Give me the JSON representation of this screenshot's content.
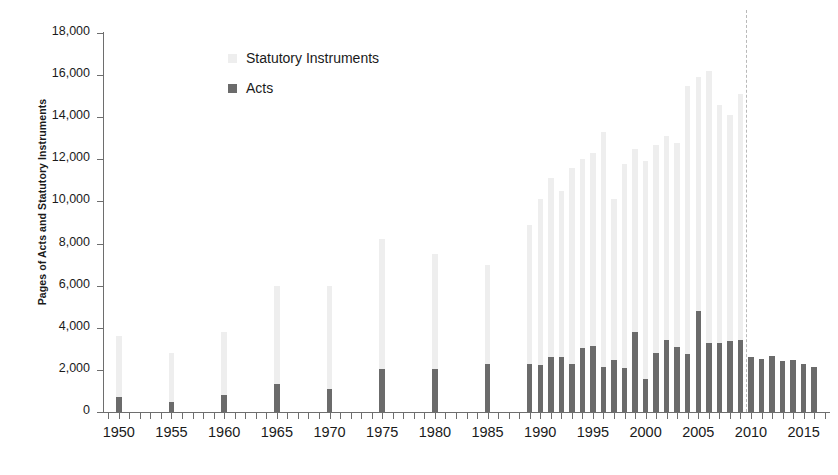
{
  "chart_data": {
    "type": "bar",
    "stacked": true,
    "title": "",
    "subtitle": "",
    "xlabel": "",
    "ylabel": "Pages of Acts and Statutory Instruments",
    "ylim": [
      0,
      18000
    ],
    "ytick_step": 2000,
    "ytick_labels": [
      "0",
      "2,000",
      "4,000",
      "6,000",
      "8,000",
      "10,000",
      "12,000",
      "14,000",
      "16,000",
      "18,000"
    ],
    "ytick_values": [
      0,
      2000,
      4000,
      6000,
      8000,
      10000,
      12000,
      14000,
      16000,
      18000
    ],
    "xlim": [
      1948.5,
      2017.5
    ],
    "xtick_labels": [
      "1950",
      "1955",
      "1960",
      "1965",
      "1970",
      "1975",
      "1980",
      "1985",
      "1990",
      "1995",
      "2000",
      "2005",
      "2010",
      "2015"
    ],
    "xtick_values": [
      1950,
      1955,
      1960,
      1965,
      1970,
      1975,
      1980,
      1985,
      1990,
      1995,
      2000,
      2005,
      2010,
      2015
    ],
    "x_minor_tick_step": 1,
    "grid": false,
    "legend_position": "top-left-inside",
    "series": [
      {
        "name": "Statutory Instruments",
        "color": "#eeeeee",
        "legend_order": 1
      },
      {
        "name": "Acts",
        "color": "#6b6b6b",
        "legend_order": 2
      }
    ],
    "annotations": [
      {
        "name": "si-data-end-line",
        "type": "vline",
        "x": 2009.5,
        "style": "dashed",
        "color": "#b9b9b9",
        "label": ""
      }
    ],
    "points": [
      {
        "year": 1950,
        "acts": 700,
        "statutory_instruments": 2900,
        "total": 3600
      },
      {
        "year": 1955,
        "acts": 480,
        "statutory_instruments": 2320,
        "total": 2800
      },
      {
        "year": 1960,
        "acts": 820,
        "statutory_instruments": 2980,
        "total": 3800
      },
      {
        "year": 1965,
        "acts": 1350,
        "statutory_instruments": 4650,
        "total": 6000
      },
      {
        "year": 1970,
        "acts": 1100,
        "statutory_instruments": 4900,
        "total": 6000
      },
      {
        "year": 1975,
        "acts": 2020,
        "statutory_instruments": 6180,
        "total": 8200
      },
      {
        "year": 1980,
        "acts": 2030,
        "statutory_instruments": 5470,
        "total": 7500
      },
      {
        "year": 1985,
        "acts": 2300,
        "statutory_instruments": 4700,
        "total": 7000
      },
      {
        "year": 1989,
        "acts": 2300,
        "statutory_instruments": 6600,
        "total": 8900
      },
      {
        "year": 1990,
        "acts": 2250,
        "statutory_instruments": 7850,
        "total": 10100
      },
      {
        "year": 1991,
        "acts": 2620,
        "statutory_instruments": 8480,
        "total": 11100
      },
      {
        "year": 1992,
        "acts": 2600,
        "statutory_instruments": 7900,
        "total": 10500
      },
      {
        "year": 1993,
        "acts": 2280,
        "statutory_instruments": 9320,
        "total": 11600
      },
      {
        "year": 1994,
        "acts": 3020,
        "statutory_instruments": 8980,
        "total": 12000
      },
      {
        "year": 1995,
        "acts": 3120,
        "statutory_instruments": 9180,
        "total": 12300
      },
      {
        "year": 1996,
        "acts": 2120,
        "statutory_instruments": 11180,
        "total": 13300
      },
      {
        "year": 1997,
        "acts": 2480,
        "statutory_instruments": 7620,
        "total": 10100
      },
      {
        "year": 1998,
        "acts": 2080,
        "statutory_instruments": 9720,
        "total": 11800
      },
      {
        "year": 1999,
        "acts": 3800,
        "statutory_instruments": 8700,
        "total": 12500
      },
      {
        "year": 2000,
        "acts": 1550,
        "statutory_instruments": 10350,
        "total": 11900
      },
      {
        "year": 2001,
        "acts": 2800,
        "statutory_instruments": 9900,
        "total": 12700
      },
      {
        "year": 2002,
        "acts": 3400,
        "statutory_instruments": 9700,
        "total": 13100
      },
      {
        "year": 2003,
        "acts": 3100,
        "statutory_instruments": 9700,
        "total": 12800
      },
      {
        "year": 2004,
        "acts": 2750,
        "statutory_instruments": 12750,
        "total": 15500
      },
      {
        "year": 2005,
        "acts": 4800,
        "statutory_instruments": 11100,
        "total": 15900
      },
      {
        "year": 2006,
        "acts": 3300,
        "statutory_instruments": 12900,
        "total": 16200
      },
      {
        "year": 2007,
        "acts": 3280,
        "statutory_instruments": 11320,
        "total": 14600
      },
      {
        "year": 2008,
        "acts": 3350,
        "statutory_instruments": 10750,
        "total": 14100
      },
      {
        "year": 2009,
        "acts": 3400,
        "statutory_instruments": 11700,
        "total": 15100
      },
      {
        "year": 2010,
        "acts": 2620,
        "statutory_instruments": 0,
        "total": 2620
      },
      {
        "year": 2011,
        "acts": 2540,
        "statutory_instruments": 0,
        "total": 2540
      },
      {
        "year": 2012,
        "acts": 2650,
        "statutory_instruments": 0,
        "total": 2650
      },
      {
        "year": 2013,
        "acts": 2420,
        "statutory_instruments": 0,
        "total": 2420
      },
      {
        "year": 2014,
        "acts": 2450,
        "statutory_instruments": 0,
        "total": 2450
      },
      {
        "year": 2015,
        "acts": 2300,
        "statutory_instruments": 0,
        "total": 2300
      },
      {
        "year": 2016,
        "acts": 2120,
        "statutory_instruments": 0,
        "total": 2120
      }
    ]
  },
  "legend": {
    "items": [
      {
        "label": "Statutory Instruments",
        "color": "#eeeeee"
      },
      {
        "label": "Acts",
        "color": "#6b6b6b"
      }
    ]
  },
  "axes": {
    "y_title": "Pages of Acts and Statutory Instruments"
  }
}
